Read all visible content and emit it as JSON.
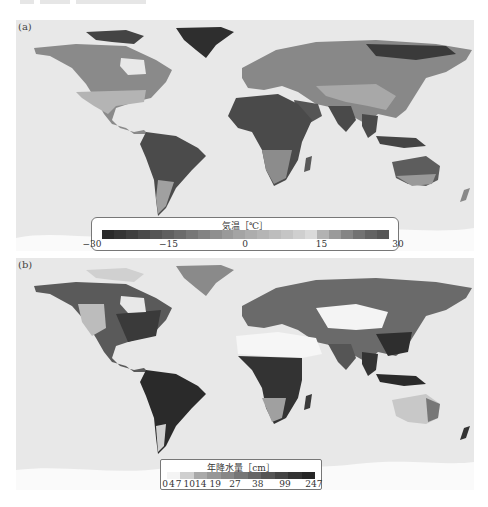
{
  "figure": {
    "panels": [
      {
        "label": "(a)",
        "variable": "air temperature",
        "legend": {
          "title": "気温［℃］",
          "ticks": [
            "−30",
            "−15",
            "0",
            "15",
            "30"
          ],
          "tick_positions": [
            0,
            25,
            50,
            75,
            100
          ],
          "range": [
            -30,
            30
          ],
          "colors": [
            "#2b2b2b",
            "#353535",
            "#3f3f3f",
            "#4a4a4a",
            "#555555",
            "#606060",
            "#6b6b6b",
            "#777777",
            "#838383",
            "#8f8f8f",
            "#9a9a9a",
            "#a4a4a4",
            "#adadad",
            "#b5b5b5",
            "#bdbdbd",
            "#c5c5c5",
            "#cfcfcf",
            "#dadada",
            "#b2b2b2",
            "#9a9a9a",
            "#858585",
            "#727272",
            "#636363",
            "#575757"
          ]
        }
      },
      {
        "label": "(b)",
        "variable": "annual precipitation",
        "legend": {
          "title": "年降水量［cm］",
          "ticks": [
            "0",
            "4",
            "7",
            "10",
            "14",
            "19",
            "27",
            "38",
            "99",
            "247"
          ],
          "tick_positions": [
            0,
            4.5,
            9,
            16,
            23.5,
            33,
            46,
            61,
            79,
            98
          ],
          "colors": [
            "#f4f4f4",
            "#cfcfcf",
            "#a9a9a9",
            "#979797",
            "#878787",
            "#767676",
            "#666666",
            "#555555",
            "#444444",
            "#333333",
            "#262626"
          ]
        }
      }
    ],
    "colors": {
      "ocean": "#e8e8e8",
      "antarctica": "#fafafa",
      "legend_border": "#777777"
    }
  }
}
